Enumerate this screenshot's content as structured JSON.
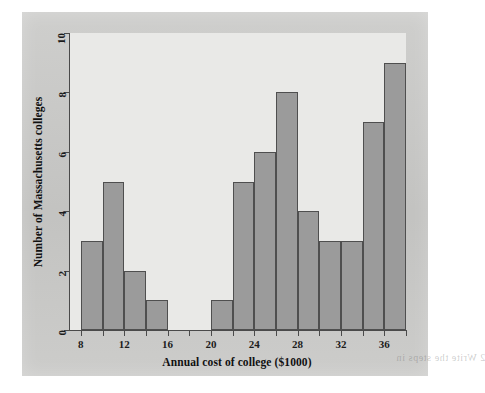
{
  "figure": {
    "ghost_text_top": "the same scale as the histogram above",
    "ghost_text_middle": "a distribution of the costs of colleges",
    "ghost_text_right": "2  Write the steps in"
  },
  "colors": {
    "page_background": "#ffffff",
    "panel_background": "#c9c9c7",
    "plot_background": "#e9e9e7",
    "bar_fill": "#9b9b9b",
    "bar_stroke": "#4f4f4f",
    "axis": "#4a4a4a",
    "text": "#111111"
  },
  "chart_data": {
    "type": "bar",
    "title": "",
    "xlabel": "Annual cost of college ($1000)",
    "ylabel": "Number of Massachusetts colleges",
    "xlim": [
      7,
      38
    ],
    "ylim": [
      0,
      10
    ],
    "bin_width": 2,
    "grid": false,
    "legend": false,
    "xticks": [
      8,
      12,
      16,
      20,
      24,
      28,
      32,
      36
    ],
    "xtick_labels": [
      "8",
      "12",
      "16",
      "20",
      "24",
      "28",
      "32",
      "36"
    ],
    "yticks": [
      0,
      2,
      4,
      6,
      8,
      10
    ],
    "ytick_labels": [
      "0",
      "2",
      "4",
      "6",
      "8",
      "10"
    ],
    "xminor_ticks": [
      10,
      14,
      18,
      22,
      26,
      30,
      34,
      38
    ],
    "bins": [
      {
        "start": 8,
        "end": 10,
        "value": 3
      },
      {
        "start": 10,
        "end": 12,
        "value": 5
      },
      {
        "start": 12,
        "end": 14,
        "value": 2
      },
      {
        "start": 14,
        "end": 16,
        "value": 1
      },
      {
        "start": 16,
        "end": 18,
        "value": 0
      },
      {
        "start": 18,
        "end": 20,
        "value": 0
      },
      {
        "start": 20,
        "end": 22,
        "value": 1
      },
      {
        "start": 22,
        "end": 24,
        "value": 5
      },
      {
        "start": 24,
        "end": 26,
        "value": 6
      },
      {
        "start": 26,
        "end": 28,
        "value": 8
      },
      {
        "start": 28,
        "end": 30,
        "value": 4
      },
      {
        "start": 30,
        "end": 32,
        "value": 3
      },
      {
        "start": 32,
        "end": 34,
        "value": 3
      },
      {
        "start": 34,
        "end": 36,
        "value": 7
      },
      {
        "start": 36,
        "end": 38,
        "value": 9
      }
    ],
    "categories": [
      "8-10",
      "10-12",
      "12-14",
      "14-16",
      "16-18",
      "18-20",
      "20-22",
      "22-24",
      "24-26",
      "26-28",
      "28-30",
      "30-32",
      "32-34",
      "34-36",
      "36-38"
    ],
    "values": [
      3,
      5,
      2,
      1,
      0,
      0,
      1,
      5,
      6,
      8,
      4,
      3,
      3,
      7,
      9
    ]
  }
}
